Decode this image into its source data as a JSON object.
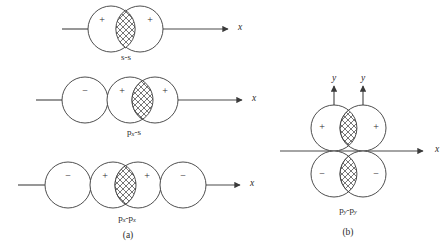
{
  "figure": {
    "width": 448,
    "height": 247,
    "background_color": "#ffffff",
    "stroke_color": "#3a3a3a",
    "axis_color": "#4a4a4a",
    "hatch_color": "#3a3a3a",
    "panels": [
      {
        "id": "a",
        "label": "(a)"
      },
      {
        "id": "b",
        "label": "(b)"
      }
    ]
  },
  "panel_a": {
    "label": "(a)",
    "rows": [
      {
        "id": "s-s",
        "pair_label": "s-s",
        "pair_label_plain": "s-s",
        "axis_label": "x",
        "signs": [
          "+",
          "+"
        ],
        "circle_count": 2
      },
      {
        "id": "px-s",
        "pair_label_main": "p",
        "pair_label_sub": "x",
        "pair_label_rest": "-s",
        "pair_label_plain": "px-s",
        "axis_label": "x",
        "signs": [
          "−",
          "+",
          "+"
        ],
        "circle_count": 3
      },
      {
        "id": "px-px",
        "pair_label_main": "p",
        "pair_label_sub": "x",
        "pair_label_rest": "-p",
        "pair_label_sub2": "x",
        "pair_label_plain": "px-px",
        "axis_label": "x",
        "signs": [
          "−",
          "+",
          "+",
          "−"
        ],
        "circle_count": 4
      }
    ]
  },
  "panel_b": {
    "label": "(b)",
    "pair_label_main": "p",
    "pair_label_sub": "y",
    "pair_label_rest": "-p",
    "pair_label_sub2": "y",
    "pair_label_plain": "py-py",
    "axis_labels": {
      "x": "x",
      "y_left": "y",
      "y_right": "y"
    },
    "signs_top": [
      "+",
      "+"
    ],
    "signs_bottom": [
      "−",
      "−"
    ],
    "lobe_count": 4
  }
}
